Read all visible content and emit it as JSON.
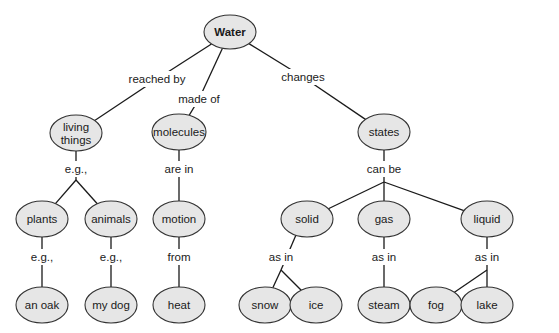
{
  "diagram": {
    "type": "concept-map",
    "colors": {
      "node_fill": "#e6e6e6",
      "node_stroke": "#333333",
      "line": "#1a1a1a",
      "background": "#ffffff"
    },
    "nodes": [
      {
        "id": "water",
        "label": "Water",
        "x": 230,
        "y": 32,
        "rx": 26,
        "ry": 17,
        "root": true
      },
      {
        "id": "living_things",
        "label": [
          "living",
          "things"
        ],
        "x": 76,
        "y": 133,
        "rx": 26,
        "ry": 18
      },
      {
        "id": "molecules",
        "label": "molecules",
        "x": 179,
        "y": 132,
        "rx": 27,
        "ry": 18
      },
      {
        "id": "states",
        "label": "states",
        "x": 384,
        "y": 132,
        "rx": 26,
        "ry": 18
      },
      {
        "id": "plants",
        "label": "plants",
        "x": 42,
        "y": 219,
        "rx": 26,
        "ry": 18
      },
      {
        "id": "animals",
        "label": "animals",
        "x": 111,
        "y": 219,
        "rx": 26,
        "ry": 18
      },
      {
        "id": "motion",
        "label": "motion",
        "x": 179,
        "y": 219,
        "rx": 26,
        "ry": 18
      },
      {
        "id": "solid",
        "label": "solid",
        "x": 307,
        "y": 219,
        "rx": 26,
        "ry": 18
      },
      {
        "id": "gas",
        "label": "gas",
        "x": 384,
        "y": 219,
        "rx": 26,
        "ry": 18
      },
      {
        "id": "liquid",
        "label": "liquid",
        "x": 487,
        "y": 219,
        "rx": 26,
        "ry": 18
      },
      {
        "id": "an_oak",
        "label": "an oak",
        "x": 42,
        "y": 305,
        "rx": 26,
        "ry": 18
      },
      {
        "id": "my_dog",
        "label": "my dog",
        "x": 111,
        "y": 305,
        "rx": 26,
        "ry": 18
      },
      {
        "id": "heat",
        "label": "heat",
        "x": 179,
        "y": 305,
        "rx": 26,
        "ry": 18
      },
      {
        "id": "snow",
        "label": "snow",
        "x": 265,
        "y": 305,
        "rx": 26,
        "ry": 18
      },
      {
        "id": "ice",
        "label": "ice",
        "x": 316,
        "y": 305,
        "rx": 26,
        "ry": 18
      },
      {
        "id": "steam",
        "label": "steam",
        "x": 384,
        "y": 305,
        "rx": 26,
        "ry": 18
      },
      {
        "id": "fog",
        "label": "fog",
        "x": 436,
        "y": 305,
        "rx": 26,
        "ry": 18
      },
      {
        "id": "lake",
        "label": "lake",
        "x": 487,
        "y": 305,
        "rx": 26,
        "ry": 18
      }
    ],
    "links": [
      {
        "label": "reached by",
        "x": 157,
        "y": 79,
        "w": 56,
        "from": "water",
        "to": [
          "living_things"
        ],
        "junction": null
      },
      {
        "label": "made of",
        "x": 199,
        "y": 99,
        "w": 42,
        "from": "water",
        "to": [
          "molecules"
        ],
        "junction": null
      },
      {
        "label": "changes",
        "x": 303,
        "y": 77,
        "w": 42,
        "from": "water",
        "to": [
          "states"
        ],
        "junction": null
      },
      {
        "label": "e.g.,",
        "x": 76,
        "y": 169,
        "w": 26,
        "from": "living_things",
        "to": [
          "plants",
          "animals"
        ],
        "junction": [
          76,
          180
        ]
      },
      {
        "label": "are in",
        "x": 179,
        "y": 169,
        "w": 32,
        "from": "molecules",
        "to": [
          "motion"
        ],
        "junction": null
      },
      {
        "label": "can be",
        "x": 384,
        "y": 169,
        "w": 36,
        "from": "states",
        "to": [
          "solid",
          "gas",
          "liquid"
        ],
        "junction": [
          384,
          182
        ]
      },
      {
        "label": "e.g.,",
        "x": 42,
        "y": 257,
        "w": 26,
        "from": "plants",
        "to": [
          "an_oak"
        ],
        "junction": null
      },
      {
        "label": "e.g.,",
        "x": 111,
        "y": 257,
        "w": 26,
        "from": "animals",
        "to": [
          "my_dog"
        ],
        "junction": null
      },
      {
        "label": "from",
        "x": 179,
        "y": 257,
        "w": 26,
        "from": "motion",
        "to": [
          "heat"
        ],
        "junction": null
      },
      {
        "label": "as in",
        "x": 281,
        "y": 257,
        "w": 28,
        "from": "solid",
        "to": [
          "snow",
          "ice"
        ],
        "junction": [
          281,
          270
        ]
      },
      {
        "label": "as in",
        "x": 384,
        "y": 257,
        "w": 28,
        "from": "gas",
        "to": [
          "steam"
        ],
        "junction": null
      },
      {
        "label": "as in",
        "x": 487,
        "y": 257,
        "w": 28,
        "from": "liquid",
        "to": [
          "fog",
          "lake"
        ],
        "junction": [
          487,
          270
        ]
      }
    ]
  }
}
